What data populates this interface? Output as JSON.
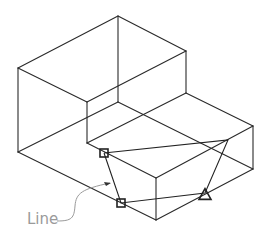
{
  "diagram": {
    "type": "isometric-wireframe",
    "colors": {
      "edge": "#2a2a2a",
      "construction": "#222222",
      "annotation": "#9a9a9a",
      "background": "#ffffff"
    },
    "vertices": {
      "top_back": [
        118,
        16
      ],
      "top_left": [
        18,
        68
      ],
      "top_front_inner": [
        87,
        102
      ],
      "top_right_upper": [
        186,
        51
      ],
      "hidden_center": [
        118,
        102
      ],
      "left_bottom": [
        18,
        152
      ],
      "step_inner": [
        87,
        143
      ],
      "step_back": [
        186,
        93
      ],
      "right_top": [
        253,
        126
      ],
      "right_bottom": [
        253,
        169
      ],
      "front_top": [
        156,
        178
      ],
      "front_bottom": [
        156,
        220
      ]
    },
    "edges": [
      [
        [
          118,
          16
        ],
        [
          186,
          51
        ]
      ],
      [
        [
          118,
          16
        ],
        [
          18,
          68
        ]
      ],
      [
        [
          18,
          68
        ],
        [
          87,
          102
        ]
      ],
      [
        [
          87,
          102
        ],
        [
          186,
          51
        ]
      ],
      [
        [
          118,
          16
        ],
        [
          118,
          102
        ]
      ],
      [
        [
          18,
          68
        ],
        [
          18,
          152
        ]
      ],
      [
        [
          87,
          102
        ],
        [
          87,
          143
        ]
      ],
      [
        [
          186,
          51
        ],
        [
          186,
          93
        ]
      ],
      [
        [
          186,
          93
        ],
        [
          253,
          126
        ]
      ],
      [
        [
          253,
          126
        ],
        [
          253,
          169
        ]
      ],
      [
        [
          18,
          152
        ],
        [
          118,
          102
        ]
      ],
      [
        [
          118,
          102
        ],
        [
          253,
          169
        ]
      ],
      [
        [
          87,
          143
        ],
        [
          186,
          93
        ]
      ],
      [
        [
          87,
          143
        ],
        [
          156,
          178
        ]
      ],
      [
        [
          156,
          178
        ],
        [
          253,
          126
        ]
      ],
      [
        [
          156,
          178
        ],
        [
          156,
          220
        ]
      ],
      [
        [
          18,
          152
        ],
        [
          156,
          220
        ]
      ],
      [
        [
          156,
          220
        ],
        [
          253,
          169
        ]
      ]
    ],
    "construction_line": {
      "points": [
        [
          104,
          153
        ],
        [
          228,
          140
        ],
        [
          205,
          193
        ],
        [
          121,
          203
        ],
        [
          104,
          153
        ]
      ]
    },
    "markers": [
      {
        "shape": "square",
        "center": [
          104,
          153
        ],
        "size": 8
      },
      {
        "shape": "square",
        "center": [
          121,
          203
        ],
        "size": 8
      },
      {
        "shape": "triangle",
        "center": [
          205,
          194
        ],
        "size": 12
      }
    ],
    "annotation": {
      "label": "Line",
      "label_position": [
        27,
        224
      ],
      "leader_path": "M57,221 C72,221 74,218 75,206 C76,193 82,189 110,183",
      "arrow_tip": [
        111,
        183
      ]
    }
  }
}
